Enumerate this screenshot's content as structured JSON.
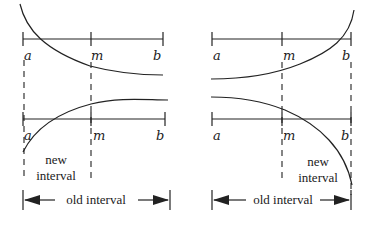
{
  "diagram": {
    "panels": [
      {
        "id": "top-left",
        "labels": {
          "a": "a",
          "m": "m",
          "b": "b"
        }
      },
      {
        "id": "top-right",
        "labels": {
          "a": "a",
          "m": "m",
          "b": "b"
        }
      },
      {
        "id": "bottom-left",
        "labels": {
          "a": "a",
          "m": "m",
          "b": "b"
        },
        "new_interval": [
          "new",
          "interval"
        ],
        "old_interval": "old interval"
      },
      {
        "id": "bottom-right",
        "labels": {
          "a": "a",
          "m": "m",
          "b": "b"
        },
        "new_interval": [
          "new",
          "interval"
        ],
        "old_interval": "old interval"
      }
    ]
  }
}
